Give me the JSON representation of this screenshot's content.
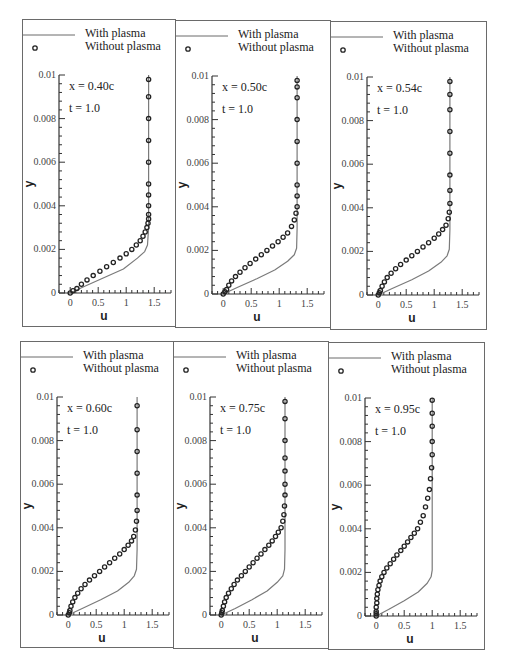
{
  "chart_data": [
    {
      "type": "line",
      "title": "",
      "annotations": [
        "x = 0.40c",
        "t = 1.0"
      ],
      "xlabel": "u",
      "ylabel": "y",
      "xlim": [
        -0.2,
        1.8
      ],
      "ylim": [
        0,
        0.01
      ],
      "xticks": [
        "0",
        "0.5",
        "1",
        "1.5"
      ],
      "yticks": [
        "0",
        "0.002",
        "0.004",
        "0.006",
        "0.008",
        "0.01"
      ],
      "legend": [
        "With plasma",
        "Without plasma"
      ],
      "series": [
        {
          "name": "With plasma",
          "style": "line",
          "x": [
            0,
            0.25,
            0.6,
            0.95,
            1.2,
            1.33,
            1.38,
            1.4,
            1.4,
            1.4
          ],
          "y": [
            0,
            0.0003,
            0.0007,
            0.0011,
            0.0016,
            0.0019,
            0.0022,
            0.003,
            0.006,
            0.01
          ]
        },
        {
          "name": "Without plasma",
          "style": "markers",
          "x": [
            0,
            0.05,
            0.12,
            0.2,
            0.3,
            0.41,
            0.53,
            0.65,
            0.77,
            0.89,
            1.0,
            1.1,
            1.18,
            1.25,
            1.3,
            1.34,
            1.37,
            1.39,
            1.4,
            1.4,
            1.4,
            1.4,
            1.4,
            1.4,
            1.4,
            1.4,
            1.4,
            1.4
          ],
          "y": [
            0,
            0.0001,
            0.0002,
            0.0004,
            0.0006,
            0.0008,
            0.001,
            0.0012,
            0.0014,
            0.0016,
            0.0018,
            0.002,
            0.0022,
            0.0024,
            0.0026,
            0.0028,
            0.003,
            0.0032,
            0.0034,
            0.0036,
            0.004,
            0.0045,
            0.005,
            0.006,
            0.007,
            0.008,
            0.009,
            0.0098
          ]
        }
      ]
    },
    {
      "type": "line",
      "title": "",
      "annotations": [
        "x = 0.50c",
        "t = 1.0"
      ],
      "xlabel": "u",
      "ylabel": "y",
      "xlim": [
        -0.2,
        1.8
      ],
      "ylim": [
        0,
        0.01
      ],
      "xticks": [
        "0",
        "0.5",
        "1",
        "1.5"
      ],
      "yticks": [
        "0",
        "0.002",
        "0.004",
        "0.006",
        "0.008",
        "0.01"
      ],
      "legend": [
        "With plasma",
        "Without plasma"
      ],
      "series": [
        {
          "name": "With plasma",
          "style": "line",
          "x": [
            0,
            0.25,
            0.6,
            0.92,
            1.15,
            1.27,
            1.31,
            1.32,
            1.32,
            1.32
          ],
          "y": [
            0,
            0.0003,
            0.0007,
            0.0011,
            0.0015,
            0.0018,
            0.0021,
            0.003,
            0.006,
            0.01
          ]
        },
        {
          "name": "Without plasma",
          "style": "markers",
          "x": [
            0,
            0.03,
            0.06,
            0.1,
            0.15,
            0.22,
            0.3,
            0.39,
            0.48,
            0.58,
            0.68,
            0.78,
            0.88,
            0.98,
            1.07,
            1.15,
            1.22,
            1.27,
            1.3,
            1.32,
            1.32,
            1.32,
            1.32,
            1.32,
            1.32,
            1.32,
            1.32,
            1.32
          ],
          "y": [
            0,
            0.0001,
            0.0002,
            0.0004,
            0.0006,
            0.0008,
            0.001,
            0.0012,
            0.0014,
            0.0016,
            0.0018,
            0.002,
            0.0022,
            0.0024,
            0.0026,
            0.0028,
            0.0031,
            0.0034,
            0.0037,
            0.004,
            0.0045,
            0.005,
            0.006,
            0.007,
            0.008,
            0.009,
            0.0095,
            0.0098
          ]
        }
      ]
    },
    {
      "type": "line",
      "title": "",
      "annotations": [
        "x = 0.54c",
        "t = 1.0"
      ],
      "xlabel": "u",
      "ylabel": "y",
      "xlim": [
        -0.2,
        1.8
      ],
      "ylim": [
        0,
        0.01
      ],
      "xticks": [
        "0",
        "0.5",
        "1",
        "1.5"
      ],
      "yticks": [
        "0",
        "0.002",
        "0.004",
        "0.006",
        "0.008",
        "0.01"
      ],
      "legend": [
        "With plasma",
        "Without plasma"
      ],
      "series": [
        {
          "name": "With plasma",
          "style": "line",
          "x": [
            0,
            0.25,
            0.6,
            0.9,
            1.12,
            1.23,
            1.27,
            1.28,
            1.28,
            1.28
          ],
          "y": [
            0,
            0.0003,
            0.0007,
            0.0011,
            0.0015,
            0.0018,
            0.0021,
            0.003,
            0.006,
            0.01
          ]
        },
        {
          "name": "Without plasma",
          "style": "markers",
          "x": [
            0,
            0.02,
            0.04,
            0.07,
            0.11,
            0.16,
            0.23,
            0.31,
            0.4,
            0.5,
            0.6,
            0.7,
            0.8,
            0.9,
            1.0,
            1.08,
            1.15,
            1.21,
            1.25,
            1.27,
            1.28,
            1.28,
            1.28,
            1.28,
            1.28,
            1.28,
            1.28,
            1.28
          ],
          "y": [
            0,
            0.0001,
            0.0002,
            0.0004,
            0.0006,
            0.0008,
            0.001,
            0.0012,
            0.0014,
            0.0016,
            0.0018,
            0.002,
            0.0022,
            0.0024,
            0.0026,
            0.0028,
            0.003,
            0.0032,
            0.0035,
            0.0038,
            0.0042,
            0.0048,
            0.0055,
            0.0065,
            0.0075,
            0.0085,
            0.0092,
            0.0098
          ]
        }
      ]
    },
    {
      "type": "line",
      "title": "",
      "annotations": [
        "x = 0.60c",
        "t = 1.0"
      ],
      "xlabel": "u",
      "ylabel": "y",
      "xlim": [
        -0.2,
        1.8
      ],
      "ylim": [
        0,
        0.01
      ],
      "xticks": [
        "0",
        "0.5",
        "1",
        "1.5"
      ],
      "yticks": [
        "0",
        "0.002",
        "0.004",
        "0.006",
        "0.008",
        "0.01"
      ],
      "legend": [
        "With plasma",
        "Without plasma"
      ],
      "series": [
        {
          "name": "With plasma",
          "style": "line",
          "x": [
            0,
            0.25,
            0.58,
            0.88,
            1.08,
            1.18,
            1.22,
            1.23,
            1.23,
            1.23
          ],
          "y": [
            0,
            0.0003,
            0.0007,
            0.0011,
            0.0015,
            0.0018,
            0.0021,
            0.003,
            0.006,
            0.01
          ]
        },
        {
          "name": "Without plasma",
          "style": "markers",
          "x": [
            0,
            0.02,
            0.03,
            0.05,
            0.08,
            0.12,
            0.17,
            0.23,
            0.3,
            0.38,
            0.47,
            0.56,
            0.65,
            0.74,
            0.83,
            0.92,
            1.0,
            1.07,
            1.13,
            1.17,
            1.2,
            1.22,
            1.23,
            1.23,
            1.23,
            1.23,
            1.23,
            1.23
          ],
          "y": [
            0,
            0.0001,
            0.0002,
            0.0004,
            0.0006,
            0.0008,
            0.001,
            0.0012,
            0.0014,
            0.0016,
            0.0018,
            0.002,
            0.0022,
            0.0024,
            0.0026,
            0.0028,
            0.003,
            0.0032,
            0.0034,
            0.0036,
            0.0039,
            0.0043,
            0.0048,
            0.0055,
            0.0065,
            0.0075,
            0.0085,
            0.0096
          ]
        }
      ]
    },
    {
      "type": "line",
      "title": "",
      "annotations": [
        "x = 0.75c",
        "t = 1.0"
      ],
      "xlabel": "u",
      "ylabel": "y",
      "xlim": [
        -0.2,
        1.8
      ],
      "ylim": [
        0,
        0.01
      ],
      "xticks": [
        "0",
        "0.5",
        "1",
        "1.5"
      ],
      "yticks": [
        "0",
        "0.002",
        "0.004",
        "0.006",
        "0.008",
        "0.01"
      ],
      "legend": [
        "With plasma",
        "Without plasma"
      ],
      "series": [
        {
          "name": "With plasma",
          "style": "line",
          "x": [
            0,
            0.25,
            0.55,
            0.82,
            1.0,
            1.1,
            1.13,
            1.14,
            1.14,
            1.14
          ],
          "y": [
            0,
            0.0003,
            0.0007,
            0.0011,
            0.0015,
            0.0018,
            0.0021,
            0.003,
            0.006,
            0.01
          ]
        },
        {
          "name": "Without plasma",
          "style": "markers",
          "x": [
            0,
            0.01,
            0.02,
            0.04,
            0.06,
            0.09,
            0.13,
            0.18,
            0.23,
            0.29,
            0.36,
            0.43,
            0.5,
            0.57,
            0.64,
            0.71,
            0.78,
            0.85,
            0.91,
            0.97,
            1.02,
            1.07,
            1.1,
            1.12,
            1.13,
            1.14,
            1.14,
            1.14,
            1.14,
            1.14,
            1.14,
            1.14
          ],
          "y": [
            0,
            0.0001,
            0.0002,
            0.0004,
            0.0006,
            0.0008,
            0.001,
            0.0012,
            0.0014,
            0.0016,
            0.0018,
            0.002,
            0.0022,
            0.0024,
            0.0026,
            0.0028,
            0.003,
            0.0032,
            0.0034,
            0.0036,
            0.0038,
            0.004,
            0.0043,
            0.0046,
            0.005,
            0.0055,
            0.006,
            0.0066,
            0.0072,
            0.008,
            0.009,
            0.0098
          ]
        }
      ]
    },
    {
      "type": "line",
      "title": "",
      "annotations": [
        "x = 0.95c",
        "t = 1.0"
      ],
      "xlabel": "u",
      "ylabel": "y",
      "xlim": [
        -0.2,
        1.8
      ],
      "ylim": [
        0,
        0.01
      ],
      "xticks": [
        "0",
        "0.5",
        "1",
        "1.5"
      ],
      "yticks": [
        "0",
        "0.002",
        "0.004",
        "0.006",
        "0.008",
        "0.01"
      ],
      "legend": [
        "With plasma",
        "Without plasma"
      ],
      "series": [
        {
          "name": "With plasma",
          "style": "line",
          "x": [
            0,
            0.22,
            0.5,
            0.75,
            0.91,
            0.98,
            1.0,
            1.0,
            1.0,
            1.0
          ],
          "y": [
            0,
            0.0003,
            0.0007,
            0.0011,
            0.0015,
            0.0018,
            0.0021,
            0.003,
            0.006,
            0.01
          ]
        },
        {
          "name": "Without plasma",
          "style": "markers",
          "x": [
            0,
            0,
            0,
            0,
            0.01,
            0.01,
            0.02,
            0.03,
            0.05,
            0.07,
            0.1,
            0.14,
            0.19,
            0.25,
            0.31,
            0.37,
            0.44,
            0.5,
            0.56,
            0.62,
            0.68,
            0.74,
            0.79,
            0.84,
            0.88,
            0.92,
            0.95,
            0.97,
            0.99,
            1.0,
            1.0,
            1.0,
            1.0,
            1.0
          ],
          "y": [
            0,
            0.0001,
            0.0002,
            0.0004,
            0.0006,
            0.0008,
            0.001,
            0.0012,
            0.0014,
            0.0016,
            0.0018,
            0.002,
            0.0022,
            0.0024,
            0.0026,
            0.0028,
            0.003,
            0.0032,
            0.0034,
            0.0036,
            0.0038,
            0.004,
            0.0043,
            0.0046,
            0.005,
            0.0054,
            0.0058,
            0.0063,
            0.0068,
            0.0074,
            0.008,
            0.0087,
            0.0093,
            0.0099
          ]
        }
      ]
    }
  ],
  "panels": [
    {
      "annotation_x": "x = 0.40c",
      "annotation_t": "t = 1.0"
    },
    {
      "annotation_x": "x = 0.50c",
      "annotation_t": "t = 1.0"
    },
    {
      "annotation_x": "x = 0.54c",
      "annotation_t": "t = 1.0"
    },
    {
      "annotation_x": "x = 0.60c",
      "annotation_t": "t = 1.0"
    },
    {
      "annotation_x": "x = 0.75c",
      "annotation_t": "t = 1.0"
    },
    {
      "annotation_x": "x = 0.95c",
      "annotation_t": "t = 1.0"
    }
  ],
  "legend": {
    "with_plasma": "With plasma",
    "without_plasma": "Without plasma"
  },
  "axes": {
    "xlabel": "u",
    "ylabel": "y",
    "xticks": [
      "0",
      "0.5",
      "1",
      "1.5"
    ],
    "yticks": [
      "0",
      "0.002",
      "0.004",
      "0.006",
      "0.008",
      "0.01"
    ]
  },
  "colors": {
    "line": "#7a7a7a",
    "marker": "#222222",
    "border": "#6a6a6a",
    "axis": "#333333"
  }
}
